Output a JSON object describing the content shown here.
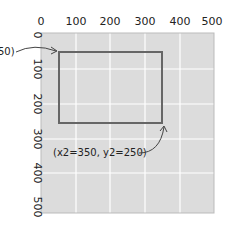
{
  "diagram": {
    "x_ticks": [
      "0",
      "100",
      "200",
      "300",
      "400",
      "500"
    ],
    "y_ticks": [
      "0",
      "100",
      "200",
      "300",
      "400",
      "500"
    ],
    "annotation_start": "(x1=50, y1=50)",
    "annotation_start_visible": "50)",
    "annotation_end": "(x2=350, y2=250)",
    "rect": {
      "x1": 50,
      "y1": 50,
      "x2": 350,
      "y2": 250
    },
    "colors": {
      "plot_bg": "#dcdcdc",
      "grid": "#ffffff",
      "rect_stroke": "#666666",
      "text": "#222222"
    }
  }
}
